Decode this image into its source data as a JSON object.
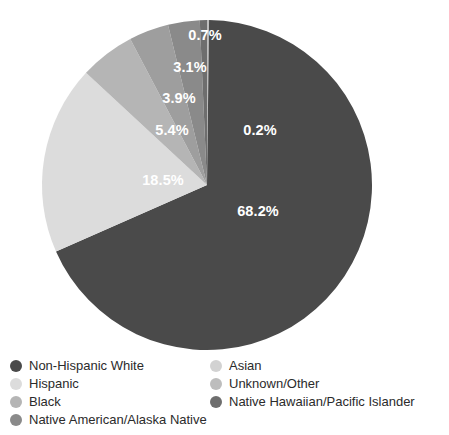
{
  "chart_data": {
    "type": "pie",
    "title": "",
    "subtitle": "",
    "xlabel": "",
    "ylabel": "",
    "grid": false,
    "legend_position": "bottom",
    "start_angle_deg": 0,
    "direction": "clockwise",
    "center": {
      "x": 207,
      "y": 185
    },
    "radius": 165,
    "categories": [
      "Unknown/Other",
      "Non-Hispanic White",
      "Hispanic",
      "Black",
      "Asian",
      "Native American/Alaska Native",
      "Native Hawaiian/Pacific Islander"
    ],
    "values": [
      0.2,
      68.2,
      18.5,
      5.4,
      3.9,
      3.1,
      0.7
    ],
    "slices": [
      {
        "name": "Unknown/Other",
        "value": 0.2,
        "label": "0.2%",
        "color": "#bdbdbd",
        "label_x": 260,
        "label_y": 131,
        "label_visible": true
      },
      {
        "name": "Non-Hispanic White",
        "value": 68.2,
        "label": "68.2%",
        "color": "#4a4a4a",
        "label_x": 258,
        "label_y": 212,
        "label_visible": true
      },
      {
        "name": "Hispanic",
        "value": 18.5,
        "label": "18.5%",
        "color": "#dcdcdc",
        "label_x": 163,
        "label_y": 181,
        "label_visible": true
      },
      {
        "name": "Black",
        "value": 5.4,
        "label": "5.4%",
        "color": "#b5b5b5",
        "label_x": 172,
        "label_y": 131,
        "label_visible": true
      },
      {
        "name": "Asian",
        "value": 3.9,
        "label": "3.9%",
        "color": "#9e9e9e",
        "label_x": 179,
        "label_y": 99,
        "label_visible": true
      },
      {
        "name": "Native American/Alaska Native",
        "value": 3.1,
        "label": "3.1%",
        "color": "#8a8a8a",
        "label_x": 190,
        "label_y": 68,
        "label_visible": true
      },
      {
        "name": "Native Hawaiian/Pacific Islander",
        "value": 0.7,
        "label": "0.7%",
        "color": "#6e6e6e",
        "label_x": 205,
        "label_y": 36,
        "label_visible": true
      }
    ]
  },
  "legend": {
    "columns": [
      {
        "items": [
          {
            "label": "Non-Hispanic White",
            "color": "#4a4a4a"
          },
          {
            "label": "Hispanic",
            "color": "#dcdcdc"
          },
          {
            "label": "Black",
            "color": "#b5b5b5"
          },
          {
            "label": "Native American/Alaska Native",
            "color": "#8a8a8a"
          }
        ]
      },
      {
        "items": [
          {
            "label": "Asian",
            "color": "#d2d2d2"
          },
          {
            "label": "Unknown/Other",
            "color": "#bdbdbd"
          },
          {
            "label": "Native Hawaiian/Pacific Islander",
            "color": "#6e6e6e"
          }
        ]
      }
    ]
  },
  "colors": {
    "background": "#ffffff",
    "label_text": "#ffffff",
    "legend_text": "#2b2b2b"
  }
}
